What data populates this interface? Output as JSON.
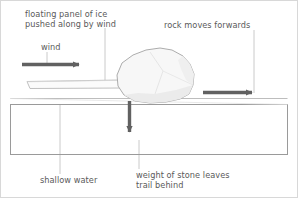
{
  "figure": {
    "kind": "schematic-diagram",
    "width": 298,
    "height": 198,
    "background_color": "#ffffff",
    "frame_color": "#d8d8d8"
  },
  "labels": {
    "ice": "floating panel of ice\npushed along by wind",
    "wind": "wind",
    "rock": "rock moves forwards",
    "water": "shallow water",
    "weight": "weight of stone leaves\ntrail behind"
  },
  "elements": {
    "ice_panel": {
      "name": "floating panel of ice",
      "fill_color": "#fbfbfb",
      "stroke_color": "#b9b9b9"
    },
    "rock": {
      "name": "rock",
      "fill_color": "#f7f7f7",
      "stroke_color": "#a5a5a5",
      "shade_color": "#ededed"
    },
    "water_box": {
      "name": "shallow water",
      "fill_color": "#ffffff",
      "stroke_color": "#9a9a9a"
    },
    "arrows": {
      "color": "#616161",
      "wind_arrow": {
        "name": "wind-direction-arrow",
        "direction": "right"
      },
      "rock_arrow": {
        "name": "rock-motion-arrow",
        "direction": "right"
      },
      "weight_arrow": {
        "name": "weight-force-arrow",
        "direction": "down"
      }
    },
    "leader_lines": {
      "color": "#c0c0c0",
      "count": 4
    }
  },
  "text_color": "#5a5a5a"
}
